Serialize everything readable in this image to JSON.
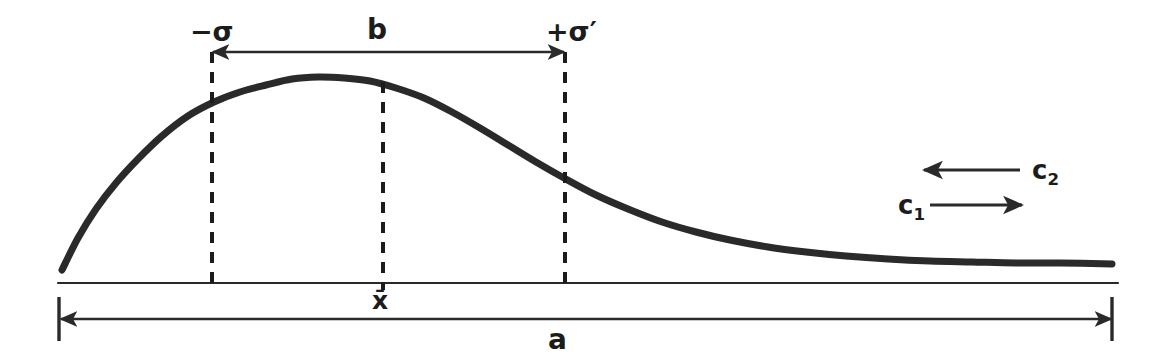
{
  "figure": {
    "kind": "hand-drawn-diagram",
    "background_color": "#ffffff",
    "ink_color": "#2a2a2a",
    "label_color": "#1c1c1c"
  },
  "labels": {
    "sigma_negative": "−σ",
    "sigma_positive": "+σ′",
    "span_b": "b",
    "mean_xbar": "x̄",
    "span_a": "a",
    "c_one_base": "c",
    "c_one_sub": "1",
    "c_two_base": "c",
    "c_two_sub": "2"
  },
  "chart_data": {
    "type": "line",
    "xlabel": "",
    "ylabel": "",
    "grid": false,
    "legend": null,
    "axis_ranges": {
      "x_pixels": [
        58,
        1118
      ],
      "y_pixels": [
        283,
        70
      ]
    },
    "series": [
      {
        "name": "distribution-curve",
        "stroke": "#2a2a2a",
        "stroke_width": 7,
        "points": [
          [
            62,
            270
          ],
          [
            78,
            238
          ],
          [
            96,
            209
          ],
          [
            116,
            183
          ],
          [
            138,
            159
          ],
          [
            162,
            136
          ],
          [
            188,
            116
          ],
          [
            214,
            102
          ],
          [
            240,
            92
          ],
          [
            266,
            85
          ],
          [
            292,
            79
          ],
          [
            318,
            77
          ],
          [
            344,
            78
          ],
          [
            370,
            81
          ],
          [
            396,
            88
          ],
          [
            424,
            98
          ],
          [
            452,
            112
          ],
          [
            480,
            128
          ],
          [
            508,
            145
          ],
          [
            536,
            162
          ],
          [
            564,
            178
          ],
          [
            596,
            195
          ],
          [
            628,
            209
          ],
          [
            662,
            222
          ],
          [
            696,
            232
          ],
          [
            730,
            240
          ],
          [
            768,
            247
          ],
          [
            806,
            252
          ],
          [
            846,
            256
          ],
          [
            888,
            259
          ],
          [
            930,
            261
          ],
          [
            972,
            262
          ],
          [
            1016,
            263
          ],
          [
            1060,
            263
          ],
          [
            1112,
            264
          ]
        ]
      }
    ],
    "annotations": [
      {
        "name": "sigma-negative-guide",
        "type": "vertical-dashed-line",
        "x": 212,
        "y_from": 52,
        "y_to": 284,
        "label": "−σ"
      },
      {
        "name": "mean-guide",
        "type": "vertical-dashed-line",
        "x": 383,
        "y_from": 82,
        "y_to": 290,
        "label": "x̄"
      },
      {
        "name": "sigma-positive-guide",
        "type": "vertical-dashed-line",
        "x": 565,
        "y_from": 52,
        "y_to": 284,
        "label": "+σ′"
      },
      {
        "name": "span-b-arrow",
        "type": "double-headed-arrow",
        "y": 52,
        "x_from": 213,
        "x_to": 564,
        "label": "b"
      },
      {
        "name": "span-a-arrow",
        "type": "double-headed-arrow",
        "y": 319,
        "x_from": 61,
        "x_to": 1111,
        "label": "a"
      },
      {
        "name": "baseline",
        "type": "horizontal-line",
        "y": 283,
        "x_from": 58,
        "x_to": 1118
      },
      {
        "name": "span-a-left-tick",
        "type": "vertical-tick",
        "x": 59,
        "y_from": 297,
        "y_to": 341
      },
      {
        "name": "span-a-right-tick",
        "type": "vertical-tick",
        "x": 1112,
        "y_from": 297,
        "y_to": 341
      },
      {
        "name": "c2-arrow",
        "type": "left-arrow",
        "y": 170,
        "x_from": 1020,
        "x_to": 924,
        "label": "c₂"
      },
      {
        "name": "c1-arrow",
        "type": "right-arrow",
        "y": 205,
        "x_from": 930,
        "x_to": 1022,
        "label": "c₁"
      }
    ]
  }
}
